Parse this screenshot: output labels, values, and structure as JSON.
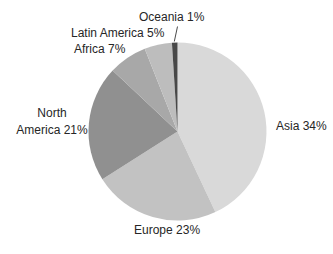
{
  "figure": {
    "background_color": "#ffffff",
    "text_color": "#262626"
  },
  "chart_data": {
    "type": "pie",
    "title": "",
    "unit": "percent",
    "direction": "clockwise",
    "start_position": "12-oclock",
    "legend": "none (direct slice labels)",
    "slices": [
      {
        "name": "Asia",
        "value_pct": 34,
        "drawn_pct": 43,
        "color": "#d9d9d9",
        "label_text": "Asia 34%"
      },
      {
        "name": "Europe",
        "value_pct": 23,
        "drawn_pct": 23,
        "color": "#c2c2c2",
        "label_text": "Europe 23%"
      },
      {
        "name": "North America",
        "value_pct": 21,
        "drawn_pct": 21,
        "color": "#909090",
        "label_line1": "North",
        "label_line2": "America 21%"
      },
      {
        "name": "Africa",
        "value_pct": 7,
        "drawn_pct": 7,
        "color": "#a8a8a8",
        "label_text": "Africa 7%"
      },
      {
        "name": "Latin America",
        "value_pct": 5,
        "drawn_pct": 5,
        "color": "#bdbdbd",
        "label_text": "Latin America 5%"
      },
      {
        "name": "Oceania",
        "value_pct": 1,
        "drawn_pct": 1,
        "color": "#484848",
        "label_text": "Oceania 1%"
      }
    ]
  }
}
